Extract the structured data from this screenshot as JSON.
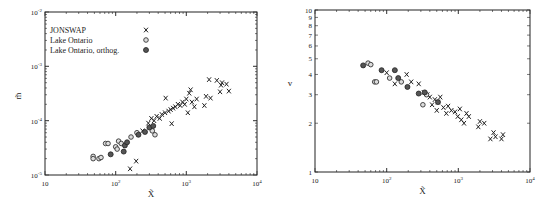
{
  "chart_data": [
    {
      "type": "scatter",
      "title": "",
      "xlabel": "X̃",
      "ylabel": "m̃",
      "xscale": "log",
      "yscale": "log",
      "xlim": [
        10,
        10000
      ],
      "ylim": [
        1e-05,
        0.01
      ],
      "x_ticks": [
        "10",
        "10²",
        "10³",
        "10⁴"
      ],
      "y_ticks": [
        "10⁻⁵",
        "10⁻⁴",
        "10⁻³",
        "10⁻²"
      ],
      "grid": false,
      "legend_position": "upper left",
      "legend": [
        {
          "label": "JONSWAP",
          "marker": "x"
        },
        {
          "label": "Lake Ontario",
          "marker": "o"
        },
        {
          "label": "Lake Ontario, orthog.",
          "marker": "filled-o"
        }
      ],
      "series": [
        {
          "name": "JONSWAP",
          "marker": "x",
          "points": [
            [
              160,
              1.3e-05
            ],
            [
              195,
              1.8e-05
            ],
            [
              240,
              6.5e-05
            ],
            [
              290,
              9e-05
            ],
            [
              320,
              0.00011
            ],
            [
              350,
              0.0001
            ],
            [
              380,
              0.00012
            ],
            [
              420,
              0.00011
            ],
            [
              450,
              0.00013
            ],
            [
              500,
              0.00014
            ],
            [
              510,
              0.00026
            ],
            [
              560,
              0.00015
            ],
            [
              600,
              0.00016
            ],
            [
              620,
              8.8e-05
            ],
            [
              650,
              0.00017
            ],
            [
              700,
              0.00018
            ],
            [
              760,
              0.0002
            ],
            [
              820,
              0.00019
            ],
            [
              880,
              0.00022
            ],
            [
              950,
              0.0002
            ],
            [
              1000,
              0.00025
            ],
            [
              1050,
              0.00014
            ],
            [
              1100,
              0.00032
            ],
            [
              1150,
              0.00037
            ],
            [
              1200,
              0.00022
            ],
            [
              1300,
              0.00018
            ],
            [
              1400,
              0.00025
            ],
            [
              1800,
              0.00019
            ],
            [
              1900,
              0.00028
            ],
            [
              2100,
              0.00057
            ],
            [
              2200,
              0.00026
            ],
            [
              2700,
              0.00055
            ],
            [
              3000,
              0.00034
            ],
            [
              3100,
              0.00045
            ],
            [
              3200,
              0.0005
            ],
            [
              3700,
              0.00047
            ],
            [
              4000,
              0.00035
            ]
          ]
        },
        {
          "name": "Lake Ontario",
          "marker": "o",
          "points": [
            [
              48,
              2.2e-05
            ],
            [
              48,
              2e-05
            ],
            [
              58,
              2e-05
            ],
            [
              62,
              2.1e-05
            ],
            [
              72,
              3.8e-05
            ],
            [
              78,
              3.8e-05
            ],
            [
              100,
              3.3e-05
            ],
            [
              105,
              3e-05
            ],
            [
              110,
              4.2e-05
            ],
            [
              120,
              3.8e-05
            ],
            [
              165,
              5e-05
            ],
            [
              200,
              6e-05
            ],
            [
              330,
              6.5e-05
            ],
            [
              360,
              5.5e-05
            ]
          ]
        },
        {
          "name": "Lake Ontario, orthog.",
          "marker": "filled-o",
          "points": [
            [
              85,
              2.4e-05
            ],
            [
              130,
              2.7e-05
            ],
            [
              135,
              3.5e-05
            ],
            [
              145,
              4e-05
            ],
            [
              210,
              5.5e-05
            ],
            [
              260,
              6.2e-05
            ],
            [
              300,
              7.5e-05
            ],
            [
              340,
              8e-05
            ]
          ]
        }
      ]
    },
    {
      "type": "scatter",
      "title": "",
      "xlabel": "X̃",
      "ylabel": "v",
      "xscale": "log",
      "yscale": "log",
      "xlim": [
        10,
        10000
      ],
      "ylim": [
        1,
        10
      ],
      "x_ticks": [
        "10",
        "10²",
        "10³",
        "10⁴"
      ],
      "y_ticks": [
        "1",
        "2",
        "3",
        "4",
        "5",
        "6",
        "7",
        "8",
        "9",
        "10"
      ],
      "grid": false,
      "series": [
        {
          "name": "JONSWAP",
          "marker": "x",
          "points": [
            [
              100,
              4.1
            ],
            [
              130,
              3.5
            ],
            [
              190,
              4.0
            ],
            [
              220,
              3.6
            ],
            [
              280,
              3.5
            ],
            [
              330,
              3.1
            ],
            [
              370,
              3.0
            ],
            [
              400,
              2.9
            ],
            [
              430,
              2.6
            ],
            [
              470,
              2.8
            ],
            [
              500,
              2.4
            ],
            [
              520,
              2.7
            ],
            [
              560,
              2.9
            ],
            [
              620,
              2.5
            ],
            [
              680,
              2.3
            ],
            [
              720,
              2.55
            ],
            [
              800,
              2.4
            ],
            [
              900,
              2.35
            ],
            [
              980,
              2.2
            ],
            [
              1050,
              2.45
            ],
            [
              1100,
              2.1
            ],
            [
              1200,
              2.0
            ],
            [
              1300,
              2.3
            ],
            [
              1400,
              2.2
            ],
            [
              1900,
              1.9
            ],
            [
              2000,
              2.05
            ],
            [
              2300,
              2.0
            ],
            [
              2800,
              1.6
            ],
            [
              3100,
              1.75
            ],
            [
              3300,
              1.65
            ],
            [
              4000,
              1.6
            ],
            [
              4200,
              1.7
            ]
          ]
        },
        {
          "name": "Lake Ontario",
          "marker": "o",
          "points": [
            [
              55,
              4.7
            ],
            [
              60,
              4.6
            ],
            [
              68,
              3.6
            ],
            [
              72,
              3.6
            ],
            [
              110,
              3.8
            ],
            [
              160,
              3.6
            ],
            [
              320,
              2.6
            ],
            [
              360,
              3.0
            ]
          ]
        },
        {
          "name": "Lake Ontario, orthog.",
          "marker": "filled-o",
          "points": [
            [
              47,
              4.55
            ],
            [
              85,
              4.25
            ],
            [
              130,
              4.25
            ],
            [
              145,
              3.8
            ],
            [
              195,
              3.35
            ],
            [
              280,
              3.05
            ],
            [
              340,
              3.1
            ],
            [
              520,
              2.7
            ]
          ]
        }
      ]
    }
  ],
  "left_chart": {
    "ylabel": "m̃",
    "xlabel": "X̃",
    "x_tick_labels": [
      {
        "base": "10",
        "exp": ""
      },
      {
        "base": "10",
        "exp": "2"
      },
      {
        "base": "10",
        "exp": "3"
      },
      {
        "base": "10",
        "exp": "4"
      }
    ],
    "y_tick_labels": [
      {
        "base": "10",
        "exp": "-5"
      },
      {
        "base": "10",
        "exp": "-4"
      },
      {
        "base": "10",
        "exp": "-3"
      },
      {
        "base": "10",
        "exp": "-2"
      }
    ],
    "legend": [
      {
        "label": "JONSWAP",
        "symbol": "x"
      },
      {
        "label": "Lake Ontario",
        "symbol": "o"
      },
      {
        "label": "Lake Ontario, orthog.",
        "symbol": "●"
      }
    ]
  },
  "right_chart": {
    "ylabel": "v",
    "xlabel": "X̃",
    "x_tick_labels": [
      {
        "base": "10",
        "exp": ""
      },
      {
        "base": "10",
        "exp": "2"
      },
      {
        "base": "10",
        "exp": "3"
      },
      {
        "base": "10",
        "exp": "4"
      }
    ],
    "y_tick_labels": [
      "1",
      "2",
      "3",
      "4",
      "5",
      "6",
      "7",
      "8",
      "9",
      "10"
    ]
  }
}
